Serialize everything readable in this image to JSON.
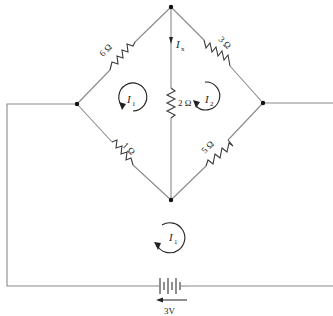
{
  "diagram": {
    "type": "circuit",
    "resistors": [
      {
        "id": "r-top-left",
        "label": "6 Ω"
      },
      {
        "id": "r-top-right",
        "label": "3 Ω"
      },
      {
        "id": "r-bottom-left",
        "label": "1 Ω"
      },
      {
        "id": "r-bottom-right",
        "label": "5 Ω"
      },
      {
        "id": "r-middle",
        "label": "2 Ω"
      }
    ],
    "currents": {
      "ix": {
        "symbol": "I",
        "sub": "x"
      },
      "loop_left": {
        "symbol": "I",
        "sub": "1"
      },
      "loop_right": {
        "symbol": "I",
        "sub": "2"
      },
      "loop_bottom": {
        "symbol": "I",
        "sub": "1"
      }
    },
    "source": {
      "label": "3V"
    }
  }
}
